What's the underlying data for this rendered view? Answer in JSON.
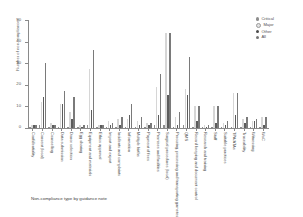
{
  "caption": "Non-compliance type by guidance note",
  "legend": {
    "position": "top-right",
    "items": [
      {
        "key": "critical",
        "label": "Critical",
        "color": "#8e8e8e"
      },
      {
        "key": "major",
        "label": "Major",
        "color": "#e2e2e2"
      },
      {
        "key": "other",
        "label": "Other",
        "color": "#4b4b4b"
      },
      {
        "key": "all",
        "label": "All",
        "color": "#757575"
      }
    ]
  },
  "chart_data": {
    "type": "bar",
    "title": "",
    "subtitle": "",
    "xlabel": "Non-compliance type by guidance note",
    "ylabel": "Number of non-compliances",
    "ylim": [
      0,
      50
    ],
    "yticks": [
      0,
      10,
      20,
      30,
      40,
      50
    ],
    "grid": false,
    "legend_position": "top-right",
    "categories": [
      "Confidentiality",
      "Consent (local)",
      "Counselling",
      "Data submission",
      "Donor selection",
      "Egg sharing",
      "Equipment and materials",
      "Ethics approval",
      "Import and export",
      "Incidents and complaints",
      "Information",
      "Multiple births",
      "Payment of fees",
      "Premises and facilities",
      "Surgical procedures (local)",
      "Procuring, processing and transporting gametes and embryos",
      "QMS",
      "Record keeping and document control",
      "Research and training",
      "Staff",
      "Suitable practices",
      "TPA/ATAs",
      "Traceability",
      "Witnessing",
      "WoC"
    ],
    "series": [
      {
        "name": "Critical",
        "color": "#8e8e8e",
        "values": [
          0,
          1,
          0,
          0,
          0,
          0,
          1,
          0,
          0,
          0,
          0,
          0,
          0,
          1,
          1,
          0,
          1,
          0,
          0,
          0,
          0,
          0,
          0,
          0,
          0
        ]
      },
      {
        "name": "Major",
        "color": "#e2e2e2",
        "values": [
          1,
          12,
          2,
          11,
          7,
          1,
          27,
          1,
          3,
          4,
          4,
          3,
          2,
          19,
          44,
          5,
          18,
          10,
          1,
          10,
          2,
          16,
          4,
          3,
          5
        ]
      },
      {
        "name": "Other",
        "color": "#4b4b4b",
        "values": [
          1,
          14,
          1,
          11,
          4,
          0,
          8,
          1,
          1,
          1,
          6,
          1,
          1,
          6,
          15,
          1,
          15,
          3,
          0,
          2,
          1,
          6,
          2,
          3,
          1
        ]
      },
      {
        "name": "All",
        "color": "#757575",
        "values": [
          1,
          30,
          1,
          17,
          14,
          1,
          36,
          1,
          2,
          5,
          11,
          5,
          2,
          25,
          44,
          7,
          33,
          10,
          1,
          10,
          3,
          16,
          5,
          4,
          5
        ]
      }
    ]
  }
}
